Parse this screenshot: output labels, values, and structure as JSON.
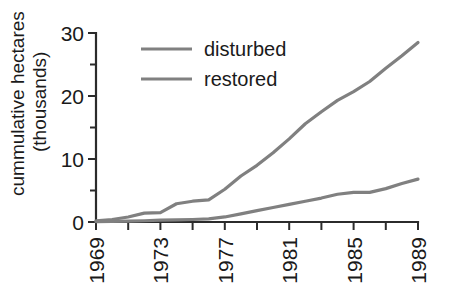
{
  "chart_data": {
    "type": "line",
    "title": "",
    "xlabel": "",
    "ylabel": "cummulative hectares (thousands)",
    "ylabel_line1": "cummulative hectares",
    "ylabel_line2": "(thousands)",
    "xlim": [
      1969,
      1989
    ],
    "ylim": [
      0,
      30
    ],
    "grid": false,
    "legend_position": "top-left-inside",
    "y_ticks": [
      0,
      10,
      20,
      30
    ],
    "y_tick_labels": [
      "0",
      "10",
      "20",
      "30"
    ],
    "y_minor_ticks": [
      5,
      15,
      25
    ],
    "x_ticks": [
      1969,
      1971,
      1973,
      1975,
      1977,
      1979,
      1981,
      1983,
      1985,
      1987,
      1989
    ],
    "x_tick_labels": [
      "1969",
      "",
      "1973",
      "",
      "1977",
      "",
      "1981",
      "",
      "1985",
      "",
      "1989"
    ],
    "x_labeled_ticks": [
      "1969",
      "1973",
      "1977",
      "1981",
      "1985",
      "1989"
    ],
    "x_tick_rotation": -90,
    "line_color": "#808080",
    "axis_color": "#2b2b2b",
    "x": [
      1969,
      1970,
      1971,
      1972,
      1973,
      1974,
      1975,
      1976,
      1977,
      1978,
      1979,
      1980,
      1981,
      1982,
      1983,
      1984,
      1985,
      1986,
      1987,
      1988,
      1989
    ],
    "series": [
      {
        "name": "disturbed",
        "values": [
          0.2,
          0.4,
          0.8,
          1.4,
          1.5,
          2.9,
          3.3,
          3.5,
          5.2,
          7.3,
          9.0,
          11.0,
          13.2,
          15.6,
          17.5,
          19.3,
          20.7,
          22.3,
          24.4,
          26.4,
          28.5
        ]
      },
      {
        "name": "restored",
        "values": [
          0.05,
          0.1,
          0.15,
          0.2,
          0.3,
          0.35,
          0.4,
          0.5,
          0.8,
          1.3,
          1.8,
          2.3,
          2.8,
          3.3,
          3.8,
          4.4,
          4.7,
          4.7,
          5.3,
          6.1,
          6.8
        ]
      }
    ],
    "legend": [
      {
        "label": "disturbed",
        "color": "#808080"
      },
      {
        "label": "restored",
        "color": "#808080"
      }
    ]
  }
}
